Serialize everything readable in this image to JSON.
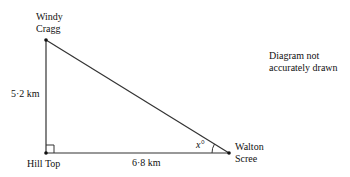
{
  "diagram": {
    "points": {
      "windy_cragg": {
        "label_line1": "Windy",
        "label_line2": "Cragg"
      },
      "hill_top": {
        "label": "Hill Top"
      },
      "walton_scree": {
        "label_line1": "Walton",
        "label_line2": "Scree"
      }
    },
    "sides": {
      "vertical": "5·2 km",
      "horizontal": "6·8 km"
    },
    "angle_label": "x°",
    "note_line1": "Diagram not",
    "note_line2": "accurately drawn",
    "colors": {
      "line": "#333333",
      "text": "#111111"
    }
  }
}
